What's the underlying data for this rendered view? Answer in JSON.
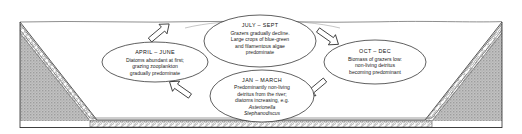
{
  "figure": {
    "name": "seasonal-cycle-in-lake-basin",
    "colors": {
      "ink": "#1b1b1b",
      "water_line": "#6a6a6a",
      "substrate_gray": "#b9b9b9",
      "substrate_dark": "#9a9a9a",
      "shore_band": "#ffffff",
      "background": "#ffffff"
    }
  },
  "basin": {
    "water_surface_label": "water-surface-line",
    "left_slope_label": "left-shore-slope",
    "right_slope_label": "right-shore-slope",
    "bed_label": "basin-bed",
    "shore_band_label": "stippled-shore-deposit",
    "substrate_label": "sediment-substrate"
  },
  "cycle": {
    "direction": "clockwise",
    "stages": [
      {
        "id": "april-june",
        "title": "APRIL – JUNE",
        "lines": [
          "Diatoms abundant at first;",
          "grazing zooplankton",
          "gradually predominate"
        ]
      },
      {
        "id": "july-sept",
        "title": "JULY – SEPT",
        "lines": [
          "Grazers gradually decline.",
          "Large crops of blue-green",
          "and filamentous algae",
          "predominate"
        ]
      },
      {
        "id": "oct-dec",
        "title": "OCT – DEC",
        "lines": [
          "Biomass of grazers low:",
          "non-living detritus",
          "becoming predominant"
        ]
      },
      {
        "id": "jan-march",
        "title": "JAN – MARCH",
        "lines": [
          "Predominantly non-living",
          "detritus from the river;",
          "diatoms increasing, e.g."
        ],
        "species": [
          "Asterionella",
          "Stephanodiscus"
        ]
      }
    ],
    "arrows": [
      {
        "id": "arrow-april-june-to-july-sept",
        "from": "april-june",
        "to": "july-sept"
      },
      {
        "id": "arrow-july-sept-to-oct-dec",
        "from": "july-sept",
        "to": "oct-dec"
      },
      {
        "id": "arrow-oct-dec-to-jan-march",
        "from": "oct-dec",
        "to": "jan-march"
      },
      {
        "id": "arrow-jan-march-to-april-june",
        "from": "jan-march",
        "to": "april-june"
      }
    ]
  }
}
